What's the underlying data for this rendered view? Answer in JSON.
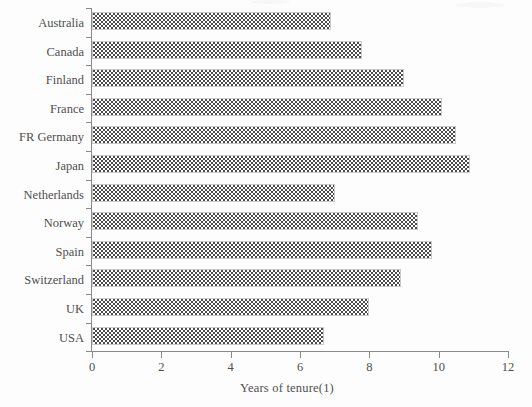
{
  "chart_data": {
    "type": "bar",
    "orientation": "horizontal",
    "title": "",
    "subtitle": "",
    "xlabel": "Years of tenure(1)",
    "ylabel": "",
    "xlim": [
      0,
      12
    ],
    "xticks": [
      0,
      2,
      4,
      6,
      8,
      10,
      12
    ],
    "xtick_labels": [
      "0",
      "2",
      "4",
      "6",
      "8",
      "10",
      "12"
    ],
    "grid": false,
    "legend": null,
    "categories": [
      "Australia",
      "Canada",
      "Finland",
      "France",
      "FR Germany",
      "Japan",
      "Netherlands",
      "Norway",
      "Spain",
      "Switzerland",
      "UK",
      "USA"
    ],
    "values": [
      6.9,
      7.8,
      9.0,
      10.1,
      10.5,
      10.9,
      7.0,
      9.4,
      9.8,
      8.9,
      8.0,
      6.7
    ],
    "series": [
      {
        "name": "Years of tenure(1)",
        "values": [
          6.9,
          7.8,
          9.0,
          10.1,
          10.5,
          10.9,
          7.0,
          9.4,
          9.8,
          8.9,
          8.0,
          6.7
        ]
      }
    ],
    "bar_fill": "dotted-hatch",
    "bar_edge_color": "#c9c9c9",
    "bar_dot_color": "#4b4b4b",
    "axis_color": "#8a8a8a",
    "text_color": "#4f4f4f",
    "background_color": "#ffffff"
  }
}
